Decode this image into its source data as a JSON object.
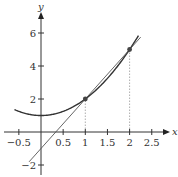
{
  "chart_data": {
    "type": "line",
    "title": "",
    "xlabel": "x",
    "ylabel": "y",
    "xlim": [
      -0.6,
      2.7
    ],
    "ylim": [
      -2.3,
      7.1
    ],
    "grid": false,
    "legend": null,
    "x_ticks": [
      -0.5,
      0.5,
      1,
      1.5,
      2,
      2.5
    ],
    "x_tick_labels": [
      "−0.5",
      "0.5",
      "1",
      "1.5",
      "2",
      "2.5"
    ],
    "y_ticks": [
      -2,
      2,
      4,
      6
    ],
    "y_tick_labels": [
      "−2",
      "2",
      "4",
      "6"
    ],
    "series": [
      {
        "name": "curve",
        "expression": "y = x^2 + 1",
        "x": [
          -0.6,
          -0.4,
          -0.2,
          0,
          0.2,
          0.4,
          0.6,
          0.8,
          1.0,
          1.2,
          1.4,
          1.6,
          1.8,
          2.0,
          2.2
        ],
        "values": [
          1.36,
          1.16,
          1.04,
          1.0,
          1.04,
          1.16,
          1.36,
          1.64,
          2.0,
          2.44,
          2.96,
          3.56,
          4.24,
          5.0,
          5.84
        ],
        "color": "#333333"
      },
      {
        "name": "secant line",
        "expression": "y = 3x - 1",
        "x": [
          -0.27,
          2.25
        ],
        "values": [
          -1.81,
          5.75
        ],
        "color": "#555555"
      }
    ],
    "points": [
      {
        "x": 1,
        "y": 2
      },
      {
        "x": 2,
        "y": 5
      }
    ],
    "annotations": [
      {
        "type": "dotted-vertical",
        "x": 1,
        "from_y": 0,
        "to_y": 2
      },
      {
        "type": "dotted-vertical",
        "x": 2,
        "from_y": 0,
        "to_y": 5
      }
    ]
  },
  "colors": {
    "axis": "#333333",
    "curve": "#333333",
    "line": "#555555",
    "point": "#444444",
    "dotted": "#999999"
  }
}
